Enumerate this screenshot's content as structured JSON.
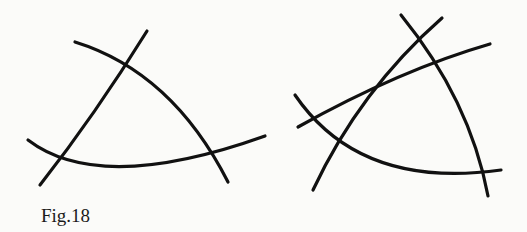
{
  "figure": {
    "caption": "Fig.18",
    "stroke_color": "#111111",
    "background_color": "#fbfbf9",
    "panels": [
      {
        "name": "left-triangle-construction",
        "description": "Three intersecting curves forming a curved triangle",
        "curves": [
          {
            "name": "top-arc",
            "path": "M 75 42 Q 172 72 228 182"
          },
          {
            "name": "left-line",
            "path": "M 40 185 Q 95 115 147 31"
          },
          {
            "name": "bottom-arc",
            "path": "M 28 140 Q 100 195 265 136"
          }
        ],
        "intersections": [
          [
            123,
            61
          ],
          [
            60,
            162
          ],
          [
            213,
            157
          ]
        ]
      },
      {
        "name": "right-triangle-construction",
        "description": "Four intersecting curves forming a curved triangle with an extra crossing line",
        "curves": [
          {
            "name": "steep-line",
            "path": "M 313 190 Q 360 90 442 18"
          },
          {
            "name": "shallow-line",
            "path": "M 298 127 Q 400 70 490 44"
          },
          {
            "name": "right-arc",
            "path": "M 401 15 Q 470 100 488 196"
          },
          {
            "name": "bottom-arc",
            "path": "M 295 95 Q 360 190 501 170"
          }
        ],
        "intersections": [
          [
            420,
            36
          ],
          [
            434,
            61
          ],
          [
            311,
            117
          ],
          [
            343,
            148
          ],
          [
            484,
            175
          ]
        ]
      }
    ]
  }
}
